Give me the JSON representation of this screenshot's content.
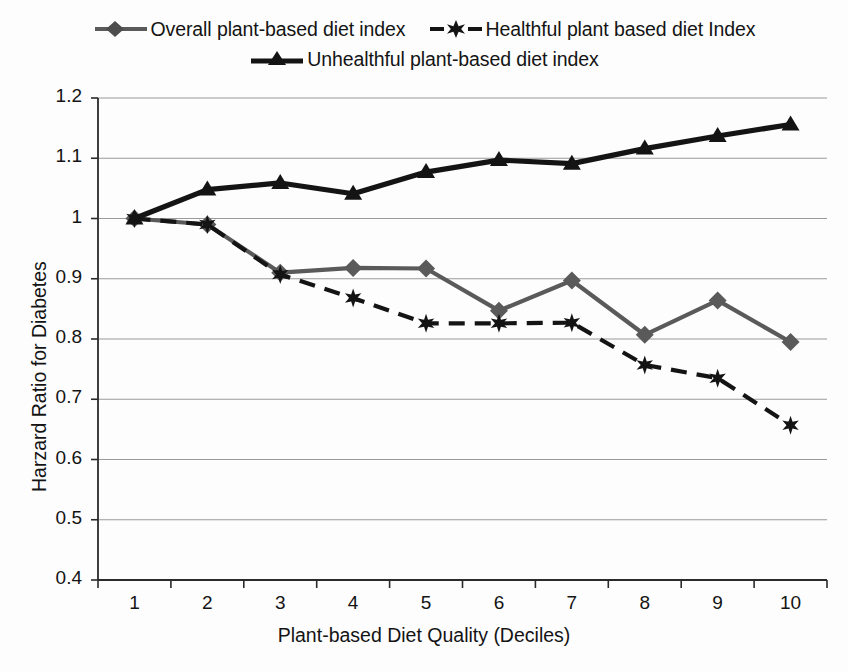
{
  "chart_data": {
    "type": "line",
    "title": "",
    "xlabel": "Plant-based Diet Quality (Deciles)",
    "ylabel": "Harzard Ratio for Diabetes",
    "categories": [
      "1",
      "2",
      "3",
      "4",
      "5",
      "6",
      "7",
      "8",
      "9",
      "10"
    ],
    "ylim": [
      0.4,
      1.2
    ],
    "ytick_labels": [
      "1.2",
      "1.1",
      "1",
      "0.9",
      "0.8",
      "0.7",
      "0.6",
      "0.5",
      "0.4"
    ],
    "ytick_values": [
      1.2,
      1.1,
      1.0,
      0.9,
      0.8,
      0.7,
      0.6,
      0.5,
      0.4
    ],
    "grid": true,
    "legend_position": "top",
    "series": [
      {
        "name": "Overall plant-based diet index",
        "values": [
          1.0,
          0.99,
          0.91,
          0.918,
          0.917,
          0.847,
          0.897,
          0.807,
          0.864,
          0.795
        ],
        "color": "#5a5a5a",
        "line_style": "solid",
        "marker": "diamond"
      },
      {
        "name": "Healthful plant based diet Index",
        "values": [
          1.0,
          0.99,
          0.907,
          0.868,
          0.826,
          0.826,
          0.827,
          0.757,
          0.735,
          0.657
        ],
        "color": "#141414",
        "line_style": "dashed",
        "marker": "star"
      },
      {
        "name": "Unhealthful plant-based diet index",
        "values": [
          1.0,
          1.048,
          1.059,
          1.041,
          1.077,
          1.097,
          1.091,
          1.116,
          1.137,
          1.156
        ],
        "color": "#141414",
        "line_style": "solid",
        "marker": "triangle"
      }
    ]
  },
  "axis_colors": {
    "gridline": "#9a9a9a",
    "axis": "#2a2a2a"
  }
}
